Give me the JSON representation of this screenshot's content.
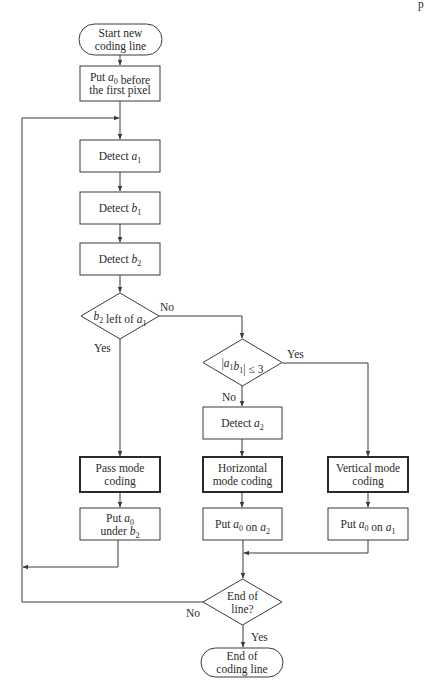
{
  "page_marker": "p",
  "nodes": {
    "start": {
      "type": "terminal",
      "lines": [
        "Start new",
        "coding line"
      ]
    },
    "put_a0_before": {
      "type": "process",
      "lines": [
        "Put a0 before",
        "the first pixel"
      ],
      "rich": [
        [
          {
            "t": "Put "
          },
          {
            "t": "a",
            "i": true
          },
          {
            "t": "0",
            "sub": true
          },
          {
            "t": " before"
          }
        ],
        [
          {
            "t": "the first pixel"
          }
        ]
      ]
    },
    "detect_a1": {
      "type": "process",
      "rich": [
        [
          {
            "t": "Detect "
          },
          {
            "t": "a",
            "i": true
          },
          {
            "t": "1",
            "sub": true
          }
        ]
      ]
    },
    "detect_b1": {
      "type": "process",
      "rich": [
        [
          {
            "t": "Detect "
          },
          {
            "t": "b",
            "i": true
          },
          {
            "t": "1",
            "sub": true
          }
        ]
      ]
    },
    "detect_b2": {
      "type": "process",
      "rich": [
        [
          {
            "t": "Detect "
          },
          {
            "t": "b",
            "i": true
          },
          {
            "t": "2",
            "sub": true
          }
        ]
      ]
    },
    "decision_b2_left": {
      "type": "decision",
      "rich": [
        [
          {
            "t": "b",
            "i": true
          },
          {
            "t": "2",
            "sub": true
          },
          {
            "t": " left of "
          },
          {
            "t": "a",
            "i": true
          },
          {
            "t": "1",
            "sub": true
          }
        ]
      ]
    },
    "decision_a1b1": {
      "type": "decision",
      "rich": [
        [
          {
            "t": "|"
          },
          {
            "t": "a",
            "i": true
          },
          {
            "t": "1",
            "sub": true
          },
          {
            "t": "b",
            "i": true
          },
          {
            "t": "1",
            "sub": true
          },
          {
            "t": "| ≤ 3"
          }
        ]
      ]
    },
    "detect_a2": {
      "type": "process",
      "rich": [
        [
          {
            "t": "Detect "
          },
          {
            "t": "a",
            "i": true
          },
          {
            "t": "2",
            "sub": true
          }
        ]
      ]
    },
    "pass_mode": {
      "type": "process-bold",
      "lines": [
        "Pass mode",
        "coding"
      ]
    },
    "horizontal_mode": {
      "type": "process-bold",
      "lines": [
        "Horizontal",
        "mode coding"
      ]
    },
    "vertical_mode": {
      "type": "process-bold",
      "lines": [
        "Vertical mode",
        "coding"
      ]
    },
    "put_a0_under_b2": {
      "type": "process",
      "rich": [
        [
          {
            "t": "Put "
          },
          {
            "t": "a",
            "i": true
          },
          {
            "t": "0",
            "sub": true
          }
        ],
        [
          {
            "t": "under "
          },
          {
            "t": "b",
            "i": true
          },
          {
            "t": "2",
            "sub": true
          }
        ]
      ]
    },
    "put_a0_on_a2": {
      "type": "process",
      "rich": [
        [
          {
            "t": "Put "
          },
          {
            "t": "a",
            "i": true
          },
          {
            "t": "0",
            "sub": true
          },
          {
            "t": " on "
          },
          {
            "t": "a",
            "i": true
          },
          {
            "t": "2",
            "sub": true
          }
        ]
      ]
    },
    "put_a0_on_a1": {
      "type": "process",
      "rich": [
        [
          {
            "t": "Put "
          },
          {
            "t": "a",
            "i": true
          },
          {
            "t": "0",
            "sub": true
          },
          {
            "t": " on "
          },
          {
            "t": "a",
            "i": true
          },
          {
            "t": "1",
            "sub": true
          }
        ]
      ]
    },
    "decision_end": {
      "type": "decision",
      "lines": [
        "End of",
        "line?"
      ]
    },
    "end": {
      "type": "terminal",
      "lines": [
        "End of",
        "coding line"
      ]
    }
  },
  "edge_labels": {
    "b2_left_no": "No",
    "b2_left_yes": "Yes",
    "a1b1_yes": "Yes",
    "a1b1_no": "No",
    "end_no": "No",
    "end_yes": "Yes"
  }
}
